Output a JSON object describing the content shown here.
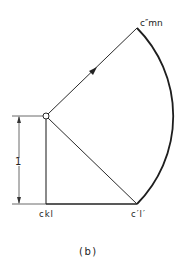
{
  "figure": {
    "caption": "(b)",
    "labels": {
      "top_point": "c″mn",
      "bottom_left": "ckl",
      "bottom_right": "c′l′",
      "dimension": "1"
    },
    "colors": {
      "stroke": "#2a2a2a",
      "background": "#ffffff"
    }
  }
}
